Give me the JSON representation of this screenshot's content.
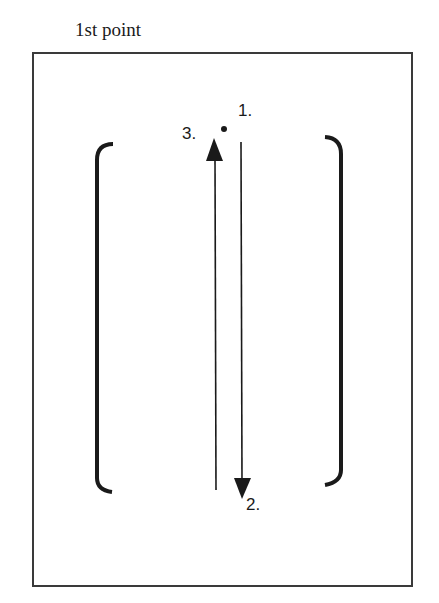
{
  "title": "1st point",
  "frame": {
    "stroke_color": "#3a3a3a"
  },
  "markers": {
    "point_dot": {
      "label": "1.",
      "x": 224,
      "y": 129
    },
    "down_arrow": {
      "label": "2.",
      "from": [
        241,
        142
      ],
      "to": [
        242,
        498
      ]
    },
    "up_arrow": {
      "label": "3.",
      "from": [
        216,
        490
      ],
      "to": [
        214,
        138
      ]
    }
  },
  "labels": {
    "one": "1.",
    "two": "2.",
    "three": "3."
  },
  "brackets": {
    "left": {
      "x": 97,
      "top": 144,
      "bottom": 490
    },
    "right": {
      "x": 341,
      "top": 138,
      "bottom": 482
    }
  },
  "colors": {
    "ink": "#1a1a1a",
    "background": "#ffffff"
  }
}
